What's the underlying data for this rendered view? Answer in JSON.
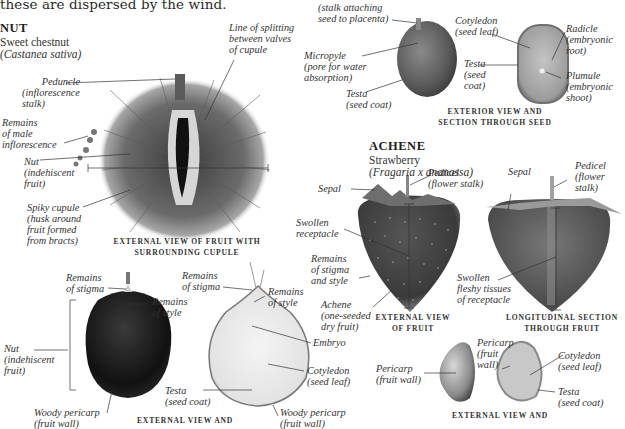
{
  "intro_text": "these are dispersed by the wind.",
  "nut_section": {
    "heading": "NUT",
    "common_name": "Sweet chestnut",
    "latin_name": "(Castanea sativa)",
    "caption": "EXTERNAL VIEW OF FRUIT WITH\nSURROUNDING CUPULE",
    "caption_line1": "EXTERNAL VIEW OF FRUIT WITH",
    "caption_line2": "SURROUNDING CUPULE",
    "labels": {
      "peduncle": [
        "Peduncle",
        "(inflorescence",
        "stalk)"
      ],
      "line_of_splitting": [
        "Line of splitting",
        "between valves",
        "of cupule"
      ],
      "remains_male": [
        "Remains",
        "of male",
        "inflorescence"
      ],
      "nut": [
        "Nut",
        "(indehiscent",
        "fruit)"
      ],
      "spiky_cupule": [
        "Spiky cupule",
        "(husk around",
        "fruit formed",
        "from bracts)"
      ]
    }
  },
  "nut_lower": {
    "caption": "EXTERNAL VIEW AND",
    "labels": {
      "remains_stigma_left": [
        "Remains",
        "of stigma"
      ],
      "remains_style_left": [
        "Remains",
        "of style"
      ],
      "nut": [
        "Nut",
        "(indehiscent",
        "fruit)"
      ],
      "woody_pericarp_left": [
        "Woody pericarp",
        "(fruit wall)"
      ],
      "remains_stigma_right": [
        "Remains",
        "of stigma"
      ],
      "remains_style_right": [
        "Remains",
        "of style"
      ],
      "embryo": [
        "Embryo"
      ],
      "cotyledon": [
        "Cotyledon",
        "(seed leaf)"
      ],
      "testa": [
        "Testa",
        "(seed coat)"
      ],
      "woody_pericarp_right": [
        "Woody pericarp",
        "(fruit wall)"
      ]
    }
  },
  "seed_section": {
    "caption_line1": "EXTERIOR VIEW AND",
    "caption_line2": "SECTION THROUGH SEED",
    "labels": {
      "funicle": [
        "(stalk attaching",
        "seed to placenta)"
      ],
      "micropyle": [
        "Micropyle",
        "(pore for water",
        "absorption)"
      ],
      "testa_ext": [
        "Testa",
        "(seed coat)"
      ],
      "cotyledon": [
        "Cotyledon",
        "(seed leaf)"
      ],
      "testa_sec": [
        "Testa",
        "(seed",
        "coat)"
      ],
      "radicle": [
        "Radicle",
        "(embryonic",
        "root)"
      ],
      "plumule": [
        "Plumule",
        "(embryonic",
        "shoot)"
      ]
    }
  },
  "achene_section": {
    "heading": "ACHENE",
    "common_name": "Strawberry",
    "latin_name": "(Fragaria x ananassa)",
    "caption_ext_line1": "EXTERNAL VIEW",
    "caption_ext_line2": "OF FRUIT",
    "caption_long_line1": "LONGITUDINAL SECTION",
    "caption_long_line2": "THROUGH FRUIT",
    "caption_lower": "EXTERNAL VIEW AND",
    "labels": {
      "sepal_left": [
        "Sepal"
      ],
      "pedicel_left": [
        "Pedicel",
        "(flower stalk)"
      ],
      "swollen_receptacle": [
        "Swollen",
        "receptacle"
      ],
      "remains_stigma_style": [
        "Remains",
        "of stigma",
        "and style"
      ],
      "achene": [
        "Achene",
        "(one-seeded",
        "dry fruit)"
      ],
      "sepal_right": [
        "Sepal"
      ],
      "pedicel_right": [
        "Pedicel",
        "(flower",
        "stalk)"
      ],
      "swollen_fleshy": [
        "Swollen",
        "fleshy tissues",
        "of receptacle"
      ],
      "pericarp_left": [
        "Pericarp",
        "(fruit wall)"
      ],
      "pericarp_right": [
        "Pericarp",
        "(fruit",
        "wall)"
      ],
      "cotyledon": [
        "Cotyledon",
        "(seed leaf)"
      ],
      "testa": [
        "Testa",
        "(seed coat)"
      ]
    }
  }
}
